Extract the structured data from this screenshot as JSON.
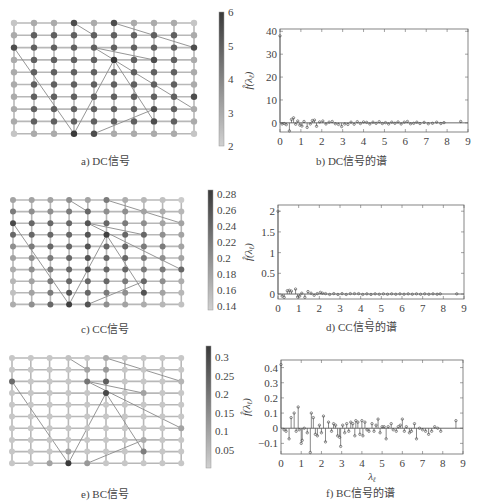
{
  "figure": {
    "panels": [
      {
        "id": "a",
        "caption": "a) DC信号"
      },
      {
        "id": "b",
        "caption": "b) DC信号的谱"
      },
      {
        "id": "c",
        "caption": "c) CC信号"
      },
      {
        "id": "d",
        "caption": "d) CC信号的谱"
      },
      {
        "id": "e",
        "caption": "e) BC信号"
      },
      {
        "id": "f",
        "caption": "f) BC信号的谱"
      }
    ]
  },
  "chart_data": [
    {
      "type": "heatmap",
      "title": "a) DC信号",
      "description": "10x10 grid graph with shortcut edges; node shade = signal value",
      "grid": {
        "cols": 10,
        "rows": 10
      },
      "shortcut_edges": [
        [
          [
            3,
            0
          ],
          [
            4,
            1
          ]
        ],
        [
          [
            5,
            0
          ],
          [
            9,
            2
          ]
        ],
        [
          [
            0,
            2
          ],
          [
            3,
            9
          ]
        ],
        [
          [
            3,
            9
          ],
          [
            5,
            3
          ]
        ],
        [
          [
            4,
            2
          ],
          [
            7,
            3
          ]
        ],
        [
          [
            4,
            2
          ],
          [
            9,
            7
          ]
        ],
        [
          [
            5,
            3
          ],
          [
            7,
            8
          ]
        ],
        [
          [
            4,
            9
          ],
          [
            7,
            7
          ]
        ]
      ],
      "colorbar": {
        "min": 2,
        "max": 6,
        "ticks": [
          "2",
          "3",
          "4",
          "5",
          "6"
        ]
      },
      "values": [
        [
          2.3,
          3,
          3,
          5.5,
          3,
          5.5,
          3,
          3,
          3,
          2.3
        ],
        [
          3,
          5,
          5,
          5,
          5,
          5,
          5,
          5,
          5,
          3
        ],
        [
          5.5,
          5,
          5,
          5,
          5,
          5,
          5,
          5,
          5,
          5.5
        ],
        [
          3,
          5,
          5,
          5,
          5,
          6,
          5,
          5.5,
          5,
          3
        ],
        [
          3,
          5,
          5,
          5,
          5,
          5,
          5,
          5,
          5,
          3
        ],
        [
          3,
          5,
          5,
          5,
          5,
          5,
          5,
          5,
          5,
          3
        ],
        [
          3,
          5,
          5,
          5,
          5,
          5,
          5,
          5,
          5,
          5.5
        ],
        [
          3,
          5,
          5,
          5,
          5,
          5,
          5,
          5.5,
          5,
          3
        ],
        [
          3,
          5,
          5,
          5,
          5,
          5,
          5,
          5.5,
          5,
          3
        ],
        [
          2.3,
          3,
          3,
          6,
          5.5,
          3,
          3,
          3,
          3,
          2.3
        ]
      ]
    },
    {
      "type": "stem",
      "title": "b) DC信号的谱",
      "xlabel": "λ_ℓ",
      "ylabel": "f̂(λ_ℓ)",
      "xlim": [
        0,
        9
      ],
      "ylim": [
        -4,
        41
      ],
      "xticks": [
        "0",
        "1",
        "2",
        "3",
        "4",
        "5",
        "6",
        "7",
        "8",
        "9"
      ],
      "yticks": [
        "0",
        "10",
        "20",
        "30",
        "40"
      ],
      "x": [
        0,
        0.1,
        0.2,
        0.3,
        0.45,
        0.55,
        0.65,
        0.75,
        0.85,
        0.95,
        1.05,
        1.15,
        1.3,
        1.45,
        1.55,
        1.65,
        1.75,
        1.9,
        2.05,
        2.2,
        2.35,
        2.5,
        2.65,
        2.8,
        2.95,
        3.1,
        3.25,
        3.4,
        3.55,
        3.7,
        3.85,
        4.0,
        4.15,
        4.3,
        4.45,
        4.6,
        4.75,
        4.9,
        5.05,
        5.2,
        5.35,
        5.5,
        5.65,
        5.8,
        5.95,
        6.1,
        6.25,
        6.4,
        6.55,
        6.7,
        6.9,
        7.1,
        7.3,
        7.5,
        7.7,
        7.85,
        8.65
      ],
      "values": [
        38,
        -0.5,
        -0.3,
        -0.8,
        -3.5,
        1.5,
        2.2,
        -0.6,
        0.8,
        -1,
        -1.4,
        0.6,
        -2,
        -0.5,
        1,
        1.2,
        -1.5,
        0.4,
        0.8,
        -0.5,
        0.3,
        0.6,
        -0.4,
        -0.7,
        -1.6,
        -0.5,
        -0.7,
        0.3,
        -0.6,
        0.5,
        -0.3,
        0.4,
        0.2,
        -0.5,
        0.3,
        -0.2,
        0.5,
        -0.3,
        0.1,
        -0.5,
        0.3,
        -0.2,
        0.4,
        -0.5,
        0.3,
        0.6,
        -0.4,
        -0.2,
        0.3,
        -0.3,
        0.2,
        -0.4,
        -0.2,
        0.3,
        -0.3,
        0.1,
        0.6
      ]
    },
    {
      "type": "heatmap",
      "title": "c) CC信号",
      "grid": {
        "cols": 10,
        "rows": 10
      },
      "shortcut_edges": [
        [
          [
            3,
            0
          ],
          [
            4,
            1
          ]
        ],
        [
          [
            5,
            0
          ],
          [
            9,
            2
          ]
        ],
        [
          [
            0,
            2
          ],
          [
            3,
            9
          ]
        ],
        [
          [
            3,
            9
          ],
          [
            5,
            3
          ]
        ],
        [
          [
            4,
            2
          ],
          [
            7,
            3
          ]
        ],
        [
          [
            4,
            2
          ],
          [
            9,
            6
          ]
        ],
        [
          [
            5,
            3
          ],
          [
            7,
            8
          ]
        ],
        [
          [
            4,
            9
          ],
          [
            7,
            7
          ]
        ]
      ],
      "colorbar": {
        "min": 0.135,
        "max": 0.285,
        "ticks": [
          "0.14",
          "0.16",
          "0.18",
          "0.2",
          "0.22",
          "0.24",
          "0.26",
          "0.28"
        ]
      },
      "values": [
        [
          0.18,
          0.18,
          0.18,
          0.2,
          0.18,
          0.22,
          0.17,
          0.16,
          0.15,
          0.14
        ],
        [
          0.22,
          0.2,
          0.2,
          0.22,
          0.24,
          0.2,
          0.2,
          0.18,
          0.17,
          0.16
        ],
        [
          0.27,
          0.24,
          0.24,
          0.24,
          0.26,
          0.24,
          0.22,
          0.2,
          0.18,
          0.18
        ],
        [
          0.24,
          0.24,
          0.24,
          0.24,
          0.26,
          0.28,
          0.24,
          0.24,
          0.2,
          0.18
        ],
        [
          0.2,
          0.22,
          0.24,
          0.24,
          0.26,
          0.24,
          0.24,
          0.22,
          0.22,
          0.18
        ],
        [
          0.18,
          0.2,
          0.22,
          0.24,
          0.26,
          0.24,
          0.24,
          0.22,
          0.2,
          0.18
        ],
        [
          0.17,
          0.2,
          0.22,
          0.24,
          0.26,
          0.24,
          0.24,
          0.22,
          0.22,
          0.24
        ],
        [
          0.16,
          0.18,
          0.22,
          0.24,
          0.24,
          0.24,
          0.22,
          0.24,
          0.2,
          0.17
        ],
        [
          0.15,
          0.18,
          0.22,
          0.26,
          0.24,
          0.22,
          0.2,
          0.26,
          0.18,
          0.16
        ],
        [
          0.17,
          0.2,
          0.24,
          0.28,
          0.26,
          0.2,
          0.18,
          0.17,
          0.16,
          0.15
        ]
      ]
    },
    {
      "type": "stem",
      "title": "d) CC信号的谱",
      "xlabel": "λ_ℓ",
      "ylabel": "f̂(λ_ℓ)",
      "xlim": [
        0,
        9
      ],
      "ylim": [
        -0.12,
        2.15
      ],
      "xticks": [
        "0",
        "1",
        "2",
        "3",
        "4",
        "5",
        "6",
        "7",
        "8",
        "9"
      ],
      "yticks": [
        "0",
        "0.5",
        "1",
        "1.5",
        "2"
      ],
      "x": [
        0,
        0.2,
        0.3,
        0.45,
        0.55,
        0.65,
        0.85,
        0.95,
        1.05,
        1.15,
        1.3,
        1.45,
        1.6,
        1.75,
        1.9,
        2.05,
        2.15,
        2.3,
        2.5,
        2.7,
        2.9,
        3.1,
        3.3,
        3.5,
        3.7,
        3.9,
        4.1,
        4.3,
        4.5,
        4.7,
        4.9,
        5.1,
        5.3,
        5.5,
        5.7,
        5.9,
        6.1,
        6.3,
        6.5,
        6.7,
        6.9,
        7.1,
        7.3,
        7.5,
        7.7,
        7.85,
        8.65
      ],
      "values": [
        2.0,
        -0.05,
        -0.08,
        0.08,
        0.09,
        0.07,
        0.12,
        -0.07,
        -0.05,
        0.02,
        -0.08,
        0.06,
        0.02,
        -0.03,
        0.01,
        0.04,
        0.02,
        0.01,
        -0.01,
        0.01,
        -0.01,
        0.01,
        -0.01,
        0.01,
        0.01,
        0.01,
        -0.01,
        0.005,
        -0.01,
        0.005,
        -0.005,
        0.005,
        -0.005,
        0.005,
        -0.005,
        0.005,
        -0.005,
        0.005,
        -0.005,
        0.005,
        -0.005,
        0.005,
        -0.005,
        0.005,
        -0.005,
        0.005,
        0.005
      ]
    },
    {
      "type": "heatmap",
      "title": "e) BC信号",
      "grid": {
        "cols": 10,
        "rows": 10
      },
      "shortcut_edges": [
        [
          [
            3,
            0
          ],
          [
            4,
            1
          ]
        ],
        [
          [
            5,
            0
          ],
          [
            9,
            2
          ]
        ],
        [
          [
            0,
            2
          ],
          [
            3,
            9
          ]
        ],
        [
          [
            3,
            9
          ],
          [
            5,
            3
          ]
        ],
        [
          [
            4,
            2
          ],
          [
            7,
            3
          ]
        ],
        [
          [
            4,
            2
          ],
          [
            9,
            6
          ]
        ],
        [
          [
            5,
            3
          ],
          [
            7,
            8
          ]
        ],
        [
          [
            4,
            9
          ],
          [
            7,
            7
          ]
        ]
      ],
      "colorbar": {
        "min": 0.0,
        "max": 0.33,
        "ticks": [
          "0.05",
          "0.1",
          "0.15",
          "0.2",
          "0.25",
          "0.3"
        ]
      },
      "values": [
        [
          0.02,
          0.02,
          0.02,
          0.03,
          0.02,
          0.08,
          0.02,
          0.02,
          0.02,
          0.02
        ],
        [
          0.02,
          0.02,
          0.02,
          0.02,
          0.1,
          0.12,
          0.02,
          0.02,
          0.02,
          0.02
        ],
        [
          0.22,
          0.02,
          0.02,
          0.02,
          0.2,
          0.25,
          0.02,
          0.02,
          0.02,
          0.06
        ],
        [
          0.02,
          0.02,
          0.02,
          0.02,
          0.02,
          0.3,
          0.02,
          0.1,
          0.02,
          0.02
        ],
        [
          0.02,
          0.02,
          0.02,
          0.02,
          0.02,
          0.02,
          0.02,
          0.02,
          0.02,
          0.02
        ],
        [
          0.02,
          0.02,
          0.02,
          0.02,
          0.02,
          0.02,
          0.02,
          0.02,
          0.02,
          0.02
        ],
        [
          0.02,
          0.02,
          0.02,
          0.02,
          0.02,
          0.02,
          0.02,
          0.02,
          0.02,
          0.1
        ],
        [
          0.02,
          0.02,
          0.02,
          0.02,
          0.02,
          0.02,
          0.02,
          0.08,
          0.02,
          0.02
        ],
        [
          0.02,
          0.02,
          0.02,
          0.1,
          0.02,
          0.02,
          0.02,
          0.18,
          0.02,
          0.02
        ],
        [
          0.02,
          0.02,
          0.1,
          0.33,
          0.12,
          0.02,
          0.02,
          0.02,
          0.02,
          0.02
        ]
      ]
    },
    {
      "type": "stem",
      "title": "f) BC信号的谱",
      "xlabel": "λ_ℓ",
      "ylabel": "f̂(λ_ℓ)",
      "xlim": [
        0,
        9
      ],
      "ylim": [
        -0.17,
        0.45
      ],
      "xticks": [
        "0",
        "1",
        "2",
        "3",
        "4",
        "5",
        "6",
        "7",
        "8",
        "9"
      ],
      "yticks": [
        "-0.1",
        "0",
        "0.1",
        "0.2",
        "0.3",
        "0.4"
      ],
      "x": [
        0,
        0.15,
        0.25,
        0.4,
        0.5,
        0.65,
        0.75,
        0.85,
        0.9,
        1.0,
        1.05,
        1.15,
        1.3,
        1.45,
        1.5,
        1.6,
        1.7,
        1.8,
        1.9,
        2.0,
        2.1,
        2.2,
        2.35,
        2.5,
        2.6,
        2.7,
        2.8,
        2.9,
        2.95,
        3.05,
        3.15,
        3.25,
        3.35,
        3.45,
        3.55,
        3.65,
        3.7,
        3.8,
        3.9,
        4.0,
        4.05,
        4.15,
        4.25,
        4.35,
        4.5,
        4.6,
        4.7,
        4.8,
        4.9,
        5.0,
        5.1,
        5.2,
        5.3,
        5.45,
        5.55,
        5.7,
        5.8,
        5.9,
        6.0,
        6.1,
        6.2,
        6.35,
        6.45,
        6.6,
        6.7,
        6.85,
        7.0,
        7.15,
        7.3,
        7.45,
        7.6,
        7.75,
        7.9,
        8.65
      ],
      "values": [
        0.42,
        -0.01,
        -0.02,
        -0.07,
        0.07,
        0.1,
        -0.02,
        0.14,
        -0.01,
        -0.1,
        -0.08,
        0.0,
        -0.03,
        -0.16,
        0.1,
        0.07,
        -0.04,
        -0.05,
        0.02,
        -0.03,
        0.08,
        -0.09,
        0.04,
        -0.02,
        0.03,
        0.02,
        -0.05,
        -0.06,
        -0.12,
        0.02,
        -0.03,
        0.03,
        -0.02,
        0.04,
        0.03,
        -0.05,
        0.05,
        0.04,
        -0.04,
        0.05,
        -0.05,
        0.04,
        -0.01,
        -0.02,
        0.03,
        -0.02,
        0.02,
        0.06,
        -0.03,
        0.01,
        0.01,
        -0.07,
        0.01,
        0.03,
        -0.01,
        -0.02,
        0.01,
        0.02,
        0.06,
        -0.02,
        0.01,
        -0.03,
        -0.02,
        0.03,
        -0.07,
        0.0,
        -0.01,
        -0.02,
        -0.04,
        -0.02,
        0.01,
        0.0,
        -0.02,
        0.05
      ]
    }
  ]
}
